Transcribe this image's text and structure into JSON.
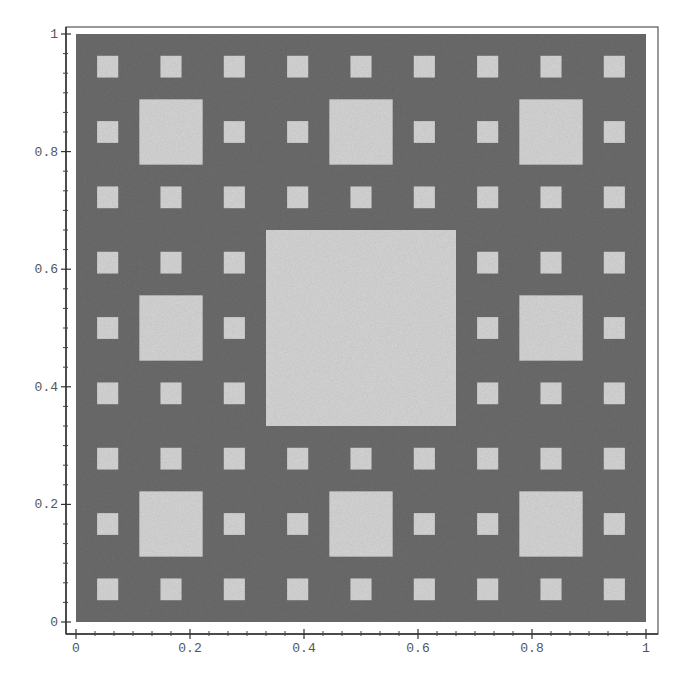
{
  "chart_data": {
    "type": "heatmap",
    "title": "",
    "subtitle": "",
    "xlabel": "",
    "ylabel": "",
    "xlim": [
      0,
      1
    ],
    "ylim": [
      0,
      1
    ],
    "grid": false,
    "legend": null,
    "x_ticks": [
      0,
      0.2,
      0.4,
      0.6,
      0.8,
      1
    ],
    "x_tick_labels": [
      "0",
      "0.2",
      "0.4",
      "0.6",
      "0.8",
      "1"
    ],
    "y_ticks": [
      0,
      0.2,
      0.4,
      0.6,
      0.8,
      1
    ],
    "y_tick_labels": [
      "0",
      "0.2",
      "0.4",
      "0.6",
      "0.8",
      "1"
    ],
    "levels": 3,
    "filled_region": {
      "x": [
        0,
        1
      ],
      "y": [
        0,
        1
      ]
    },
    "holes": {
      "level_1": {
        "size": 0.3333,
        "count": 1,
        "origins": [
          [
            0.3333,
            0.3333
          ]
        ]
      },
      "level_2": {
        "size": 0.1111,
        "count": 8
      },
      "level_3": {
        "size": 0.037,
        "count": 64
      }
    },
    "colors": {
      "filled": "#6e6e6e",
      "hole": "#d9d9d9",
      "background": "#ffffff",
      "axis": "#333333"
    }
  }
}
